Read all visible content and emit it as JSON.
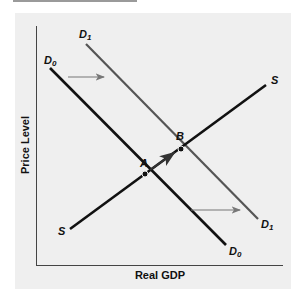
{
  "diagram": {
    "type": "aggregate-demand-supply",
    "x_axis_label": "Real GDP",
    "y_axis_label": "Price Level",
    "curves": [
      {
        "id": "D0",
        "label": "D",
        "subscript": "0",
        "color": "#111111",
        "from": [
          50,
          68
        ],
        "to": [
          226,
          245
        ]
      },
      {
        "id": "D1",
        "label": "D",
        "subscript": "1",
        "color": "#555555",
        "from": [
          86,
          44
        ],
        "to": [
          258,
          219
        ]
      },
      {
        "id": "S",
        "label": "S",
        "subscript": "",
        "color": "#111111",
        "from": [
          70,
          229
        ],
        "to": [
          266,
          85
        ]
      }
    ],
    "labels": {
      "D0_top": "D",
      "D0_top_sub": "0",
      "D1_top": "D",
      "D1_top_sub": "1",
      "D0_bottom": "D",
      "D0_bottom_sub": "0",
      "D1_bottom": "D",
      "D1_bottom_sub": "1",
      "S_top": "S",
      "S_bottom": "S"
    },
    "points": [
      {
        "name": "A",
        "x": 145,
        "y": 174
      },
      {
        "name": "B",
        "x": 181,
        "y": 149
      }
    ],
    "point_labels": {
      "A": "A",
      "B": "B"
    },
    "arrows": [
      {
        "name": "shift-arrow-top",
        "from": [
          68,
          77
        ],
        "to": [
          104,
          77
        ]
      },
      {
        "name": "shift-arrow-bottom",
        "from": [
          191,
          210
        ],
        "to": [
          240,
          210
        ]
      },
      {
        "name": "movement-arrow-A-to-B",
        "from": [
          150,
          170
        ],
        "to": [
          174,
          153
        ]
      }
    ],
    "colors": {
      "panel_bg": "#efefef",
      "curve_dark": "#111111",
      "curve_shifted": "#555555",
      "arrow": "#777777"
    }
  }
}
